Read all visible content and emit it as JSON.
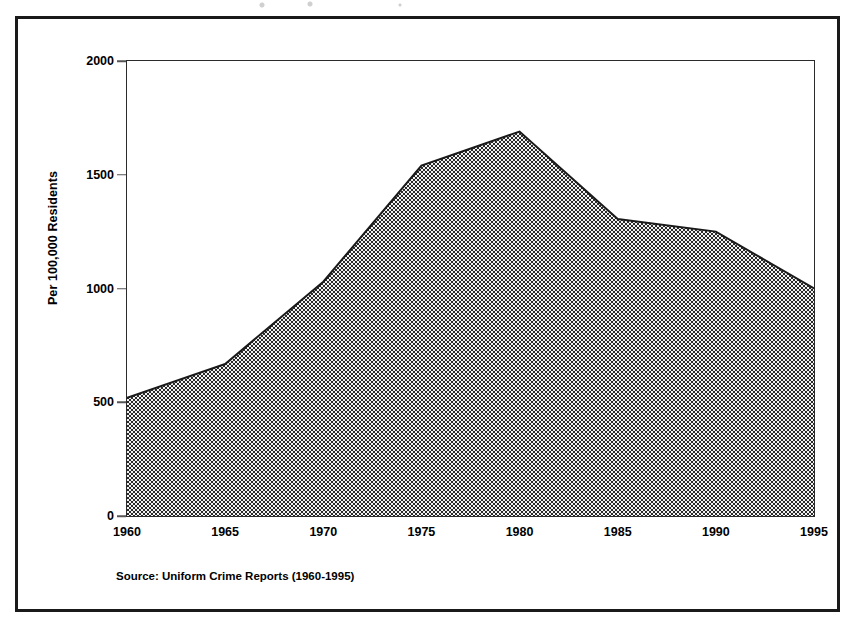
{
  "figure": {
    "source_note": "Source:  Uniform Crime Reports (1960-1995)"
  },
  "chart_data": {
    "type": "area",
    "title": "",
    "xlabel": "",
    "ylabel": "Per 100,000 Residents",
    "x": [
      1960,
      1965,
      1970,
      1975,
      1980,
      1985,
      1990,
      1995
    ],
    "values": [
      520,
      668,
      1030,
      1540,
      1690,
      1305,
      1250,
      1000
    ],
    "xtick_labels": [
      "1960",
      "1965",
      "1970",
      "1975",
      "1980",
      "1985",
      "1990",
      "1995"
    ],
    "ytick_labels": [
      "0",
      "500",
      "1000",
      "1500",
      "2000"
    ],
    "yticks": [
      0,
      500,
      1000,
      1500,
      2000
    ],
    "xlim": [
      1960,
      1995
    ],
    "ylim": [
      0,
      2000
    ],
    "grid": false,
    "legend": false,
    "series": [
      {
        "name": "Crime rate per 100,000 residents",
        "values": [
          520,
          668,
          1030,
          1540,
          1690,
          1305,
          1250,
          1000
        ]
      }
    ],
    "colors": {
      "area_fill": "#808080",
      "area_line": "#1a1a1a",
      "axis": "#2b2b2b",
      "text": "#000000"
    }
  }
}
